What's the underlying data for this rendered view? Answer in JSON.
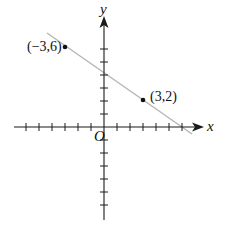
{
  "diagram": {
    "type": "coordinate-plane",
    "axes": {
      "x_label": "x",
      "y_label": "y",
      "origin_label": "O",
      "x_ticks_negative": 6,
      "x_ticks_positive": 6,
      "y_ticks_negative": 6,
      "y_ticks_positive": 6
    },
    "points": [
      {
        "label": "(−3,6)",
        "x": -3,
        "y": 6
      },
      {
        "label": "(3,2)",
        "x": 3,
        "y": 2
      }
    ],
    "line": {
      "through": [
        "(-3,6)",
        "(3,2)"
      ],
      "slope": "-2/3",
      "y_intercept": 4,
      "x_intercept": 6,
      "color": "#b5b5b5"
    },
    "colors": {
      "axis": "#1a1a1a",
      "line": "#b5b5b5",
      "point": "#111111"
    }
  }
}
